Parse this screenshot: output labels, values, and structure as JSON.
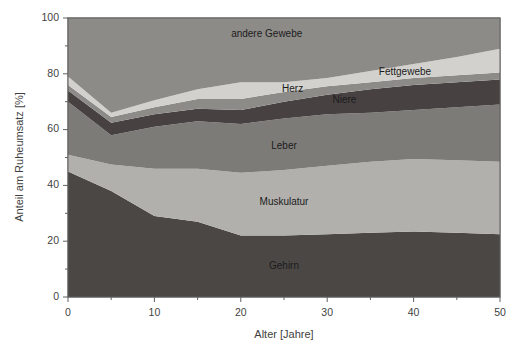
{
  "chart_data": {
    "type": "area",
    "title": "",
    "subtitle": "",
    "xlabel": "Alter [Jahre]",
    "ylabel": "Anteil am Ruheumsatz [%]",
    "xlim": [
      0,
      50
    ],
    "ylim": [
      0,
      100
    ],
    "xticks": [
      0,
      10,
      20,
      30,
      40,
      50
    ],
    "xtick_labels": [
      "0",
      "10",
      "20",
      "30",
      "40",
      "50"
    ],
    "yticks": [
      0,
      20,
      40,
      60,
      80,
      100
    ],
    "ytick_labels": [
      "0",
      "20",
      "40",
      "60",
      "80",
      "100"
    ],
    "x_minor_ticks": [
      5,
      15,
      25,
      35,
      45
    ],
    "y_minor_ticks": [
      10,
      30,
      50,
      70,
      90
    ],
    "grid": false,
    "legend_position": "inline-labels",
    "stacked": true,
    "stack_total_note": "Bands are stacked; topmost band fills to 100%.",
    "x": [
      0,
      5,
      10,
      15,
      20,
      25,
      30,
      35,
      40,
      45,
      50
    ],
    "series": [
      {
        "name": "Gehirn",
        "color": "#4a4745",
        "label_x": 25,
        "label_y": 11,
        "values": [
          45,
          38,
          29,
          27,
          22,
          22,
          22.5,
          23,
          23.5,
          23,
          22.5
        ]
      },
      {
        "name": "Muskulatur",
        "color": "#b1b0ad",
        "label_x": 25,
        "label_y": 34,
        "values": [
          6,
          9.5,
          17,
          19,
          22.5,
          23.5,
          24.5,
          25.5,
          26,
          26,
          26
        ]
      },
      {
        "name": "Leber",
        "color": "#7d7b78",
        "label_x": 25,
        "label_y": 54,
        "values": [
          19,
          10.5,
          15,
          17,
          17.5,
          18.5,
          18.5,
          17.5,
          17.5,
          19,
          20.5
        ]
      },
      {
        "name": "Niere",
        "color": "#474241",
        "label_x": 32,
        "label_y": 70.5,
        "values": [
          4,
          4.5,
          4.5,
          4.5,
          5,
          6,
          7,
          8.5,
          9,
          9,
          9
        ]
      },
      {
        "name": "Herz",
        "color": "#8d8b88",
        "label_x": 26,
        "label_y": 74.5,
        "values": [
          2,
          2,
          2.5,
          3.5,
          4,
          3.5,
          3,
          2.5,
          2.5,
          2.5,
          2.5
        ]
      },
      {
        "name": "Fettgewebe",
        "color": "#d2d1ce",
        "label_x": 39,
        "label_y": 80.5,
        "values": [
          3,
          1.5,
          2.5,
          3.5,
          6,
          3.5,
          3,
          4,
          5,
          6.5,
          8.5
        ]
      },
      {
        "name": "andere Gewebe",
        "color": "#8d8b88",
        "label_x": 23,
        "label_y": 94,
        "values": [
          21,
          34,
          29.5,
          25.5,
          23,
          23,
          21.5,
          19,
          16.5,
          14,
          11
        ]
      }
    ],
    "cumulative_upper_bounds": {
      "Gehirn": [
        45,
        38,
        29,
        27,
        22,
        22,
        22.5,
        23,
        23.5,
        23,
        22.5
      ],
      "Muskulatur": [
        51,
        47.5,
        46,
        46,
        44.5,
        45.5,
        47,
        48.5,
        49.5,
        49,
        48.5
      ],
      "Leber": [
        70,
        58,
        61,
        63,
        62,
        64,
        65.5,
        66,
        67,
        68,
        69
      ],
      "Niere": [
        74,
        62.5,
        65.5,
        67.5,
        67,
        70,
        72.5,
        74.5,
        76,
        77,
        78
      ],
      "Herz": [
        76,
        64.5,
        68,
        71,
        71,
        73.5,
        75.5,
        77,
        78.5,
        79.5,
        80.5
      ],
      "Fettgewebe": [
        79,
        66,
        70.5,
        74.5,
        77,
        77,
        78.5,
        81,
        83.5,
        86,
        89
      ],
      "andere Gewebe": [
        100,
        100,
        100,
        100,
        100,
        100,
        100,
        100,
        100,
        100,
        100
      ]
    }
  },
  "axes": {
    "x_title": "Alter [Jahre]",
    "y_title": "Anteil am Ruheumsatz [%]",
    "frame_color": "#595959"
  }
}
